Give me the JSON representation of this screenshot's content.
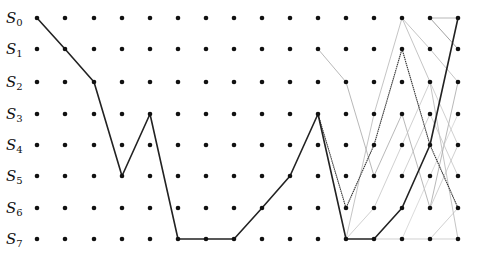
{
  "diagram": {
    "type": "trellis",
    "states": [
      "S0",
      "S1",
      "S2",
      "S3",
      "S4",
      "S5",
      "S6",
      "S7"
    ],
    "row_labels": [
      {
        "base": "S",
        "sub": "0"
      },
      {
        "base": "S",
        "sub": "1"
      },
      {
        "base": "S",
        "sub": "2"
      },
      {
        "base": "S",
        "sub": "3"
      },
      {
        "base": "S",
        "sub": "4"
      },
      {
        "base": "S",
        "sub": "5"
      },
      {
        "base": "S",
        "sub": "6"
      },
      {
        "base": "S",
        "sub": "7"
      }
    ],
    "columns": 16,
    "col_x": [
      37,
      65,
      94,
      122,
      150,
      178,
      206,
      234,
      262,
      290,
      318,
      346,
      374,
      402,
      430,
      458
    ],
    "row_y": [
      18,
      49,
      82,
      114,
      145,
      176,
      208,
      239
    ],
    "paths": [
      {
        "name": "main-path",
        "style": "thick",
        "color": "#222222",
        "width": 1.6,
        "points": [
          [
            0,
            0
          ],
          [
            1,
            1
          ],
          [
            2,
            2
          ],
          [
            3,
            5
          ],
          [
            4,
            3
          ],
          [
            5,
            7
          ],
          [
            6,
            7
          ],
          [
            7,
            7
          ],
          [
            8,
            6
          ],
          [
            9,
            5
          ],
          [
            10,
            3
          ],
          [
            11,
            7
          ],
          [
            12,
            7
          ],
          [
            13,
            6
          ],
          [
            14,
            4
          ],
          [
            15,
            0
          ]
        ]
      },
      {
        "name": "branch-path",
        "style": "medium",
        "color": "#333333",
        "width": 1.1,
        "points": [
          [
            10,
            3
          ],
          [
            11,
            6
          ],
          [
            12,
            4
          ],
          [
            13,
            1
          ],
          [
            14,
            4
          ],
          [
            15,
            6
          ]
        ]
      },
      {
        "name": "light-path-a",
        "style": "light",
        "color": "#999999",
        "width": 0.7,
        "points": [
          [
            10,
            1
          ],
          [
            11,
            2
          ],
          [
            12,
            5
          ],
          [
            13,
            3
          ],
          [
            14,
            6
          ],
          [
            15,
            2
          ]
        ]
      },
      {
        "name": "light-path-b",
        "style": "light",
        "color": "#aaaaaa",
        "width": 0.7,
        "points": [
          [
            11,
            7
          ],
          [
            12,
            3
          ],
          [
            13,
            0
          ],
          [
            14,
            2
          ],
          [
            15,
            7
          ]
        ]
      },
      {
        "name": "light-path-c",
        "style": "light",
        "color": "#aaaaaa",
        "width": 0.7,
        "points": [
          [
            13,
            0
          ],
          [
            14,
            1
          ],
          [
            15,
            2
          ]
        ]
      },
      {
        "name": "light-path-d",
        "style": "light",
        "color": "#999999",
        "width": 0.7,
        "points": [
          [
            14,
            0
          ],
          [
            15,
            0
          ]
        ]
      },
      {
        "name": "light-path-e",
        "style": "light",
        "color": "#888888",
        "width": 0.8,
        "points": [
          [
            14,
            0
          ],
          [
            15,
            1
          ]
        ]
      },
      {
        "name": "light-path-f",
        "style": "light",
        "color": "#bbbbbb",
        "width": 0.7,
        "points": [
          [
            12,
            7
          ],
          [
            13,
            7
          ],
          [
            14,
            7
          ],
          [
            15,
            7
          ]
        ]
      },
      {
        "name": "light-path-g",
        "style": "light",
        "color": "#bbbbbb",
        "width": 0.7,
        "points": [
          [
            11,
            7
          ],
          [
            12,
            6
          ],
          [
            13,
            4
          ],
          [
            14,
            2
          ],
          [
            15,
            4
          ]
        ]
      },
      {
        "name": "light-path-h",
        "style": "light",
        "color": "#bbbbbb",
        "width": 0.7,
        "points": [
          [
            13,
            5
          ],
          [
            14,
            3
          ],
          [
            15,
            5
          ]
        ]
      },
      {
        "name": "light-path-i",
        "style": "light",
        "color": "#bbbbbb",
        "width": 0.7,
        "points": [
          [
            14,
            7
          ],
          [
            15,
            6
          ]
        ]
      },
      {
        "name": "light-path-j",
        "style": "light",
        "color": "#cccccc",
        "width": 0.7,
        "points": [
          [
            13,
            7
          ],
          [
            14,
            5
          ],
          [
            15,
            3
          ]
        ]
      },
      {
        "name": "light-path-k",
        "style": "light",
        "color": "#bbbbbb",
        "width": 0.7,
        "points": [
          [
            14,
            6
          ],
          [
            15,
            4
          ]
        ]
      }
    ],
    "colors": {
      "dot": "#111111",
      "label": "#111111"
    }
  }
}
